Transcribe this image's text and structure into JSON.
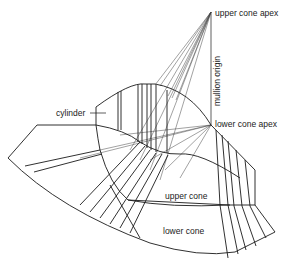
{
  "labels": {
    "upper_cone_apex": "upper cone apex",
    "mullion_origin": "mullion origin",
    "lower_cone_apex": "lower cone apex",
    "cylinder": "cylinder",
    "upper_cone": "upper cone",
    "lower_cone": "lower cone"
  },
  "points": {
    "upper_cone_apex": [
      211,
      12
    ],
    "lower_cone_apex": [
      211,
      125
    ]
  },
  "colors": {
    "line": "#1a1a1a",
    "construction_line": "#555555",
    "background": "#ffffff"
  }
}
